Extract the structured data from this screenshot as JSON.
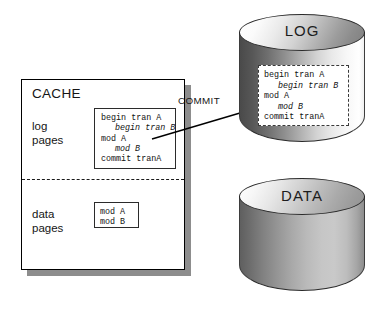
{
  "diagram": {
    "cache": {
      "title": "CACHE",
      "log_pages_label": "log\npages",
      "data_pages_label": "data\npages",
      "log_box_lines": [
        {
          "text": "begin tran A",
          "italic": false
        },
        {
          "text": "begin tran B",
          "italic": true
        },
        {
          "text": "mod A",
          "italic": false
        },
        {
          "text": "mod B",
          "italic": true
        },
        {
          "text": "commit tranA",
          "italic": false
        }
      ],
      "data_box_lines": [
        {
          "text": "mod A",
          "italic": false
        },
        {
          "text": "mod B",
          "italic": false
        }
      ]
    },
    "arrow": {
      "label": "COMMIT",
      "from": "cache-log-box",
      "to": "log-device"
    },
    "devices": [
      {
        "name": "log-device",
        "title": "LOG",
        "record_lines": [
          {
            "text": "begin tran A",
            "italic": false
          },
          {
            "text": "begin tran B",
            "italic": true
          },
          {
            "text": "mod A",
            "italic": false
          },
          {
            "text": "mod B",
            "italic": true
          },
          {
            "text": "commit tranA",
            "italic": false
          }
        ]
      },
      {
        "name": "data-device",
        "title": "DATA",
        "record_lines": []
      }
    ],
    "colors": {
      "panel_border": "#000000",
      "panel_shadow": "#8d8d8d",
      "cylinder_outline": "#2a2a2a",
      "text": "#151515",
      "arrow": "#000000"
    }
  }
}
